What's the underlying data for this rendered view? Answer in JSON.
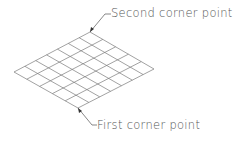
{
  "labels": {
    "second": "Second corner point",
    "first": "First corner point"
  },
  "grid": {
    "cols": 7,
    "rows": 5,
    "top": [
      90,
      32
    ],
    "right": [
      154,
      69
    ],
    "bottom": [
      78,
      108
    ],
    "left": [
      14,
      72
    ],
    "color": "#777777"
  }
}
